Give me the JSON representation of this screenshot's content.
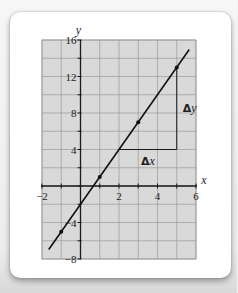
{
  "chart_data": {
    "type": "line",
    "title": "",
    "xlabel": "x",
    "ylabel": "y",
    "xlim": [
      -2,
      6
    ],
    "ylim": [
      -8,
      16
    ],
    "x_ticks": [
      -2,
      2,
      4,
      6
    ],
    "y_ticks": [
      16,
      12,
      8,
      4,
      -4,
      -8
    ],
    "x_grid_step": 1,
    "y_grid_step": 2,
    "grid": true,
    "series": [
      {
        "name": "y = 3x - 2",
        "line_from": [
          -1.65,
          -6.95
        ],
        "line_to": [
          5.65,
          14.95
        ],
        "points": [
          {
            "x": -1,
            "y": -5
          },
          {
            "x": 1,
            "y": 1
          },
          {
            "x": 3,
            "y": 7
          },
          {
            "x": 5,
            "y": 13
          }
        ]
      }
    ],
    "annotations": [
      {
        "type": "slope-run",
        "from": [
          2,
          4
        ],
        "to": [
          5,
          4
        ],
        "label": "Δx"
      },
      {
        "type": "slope-rise",
        "from": [
          5,
          4
        ],
        "to": [
          5,
          13
        ],
        "label": "Δy"
      }
    ],
    "colors": {
      "grid_fill": "#d9d9d9",
      "grid_line": "#9a9a9a",
      "axis": "#1a1a1a",
      "line": "#111111"
    }
  }
}
